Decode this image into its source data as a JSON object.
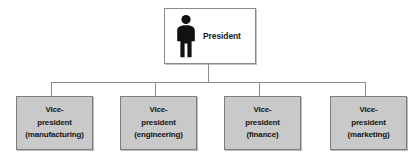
{
  "diagram": {
    "type": "organization-chart",
    "colors": {
      "page_background": "#ffffff",
      "root_fill": "#ffffff",
      "node_fill": "#c9c9c9",
      "node_border": "#7d7d7d",
      "connector": "#8d8d8d",
      "text": "#141414",
      "figure": "#111111"
    },
    "root": {
      "label": "President",
      "icon": "person-figure-icon"
    },
    "children": [
      {
        "title_line_1": "Vice-",
        "title_line_2": "president",
        "department": "(manufacturing)"
      },
      {
        "title_line_1": "Vice-",
        "title_line_2": "president",
        "department": "(engineering)"
      },
      {
        "title_line_1": "Vice-",
        "title_line_2": "president",
        "department": "(finance)"
      },
      {
        "title_line_1": "Vice-",
        "title_line_2": "president",
        "department": "(marketing)"
      }
    ]
  }
}
